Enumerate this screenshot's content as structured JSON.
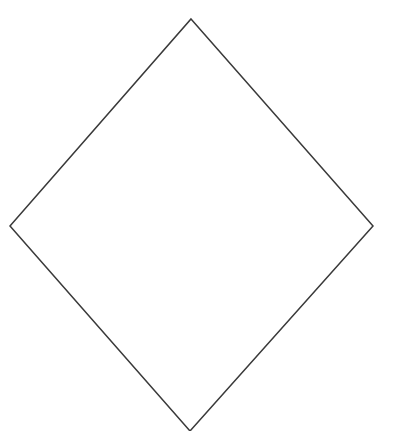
{
  "diagram": {
    "shape": "rhombus",
    "stroke_color": "#3a3a3a",
    "fill_color": "#ffffff",
    "background": "#ffffff",
    "vertices": {
      "top": [
        191,
        19
      ],
      "right": [
        373,
        226
      ],
      "bottom": [
        190,
        431
      ],
      "left": [
        10,
        226
      ]
    }
  }
}
